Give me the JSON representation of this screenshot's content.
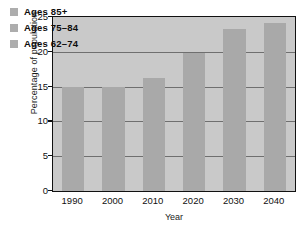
{
  "chart_data": {
    "type": "bar",
    "title": "",
    "xlabel": "Year",
    "ylabel": "Percentage of population",
    "categories": [
      "1990",
      "2000",
      "2010",
      "2020",
      "2030",
      "2040"
    ],
    "values": [
      15.0,
      15.0,
      16.3,
      19.9,
      23.3,
      24.2
    ],
    "series": [
      {
        "name": "Percentage of population",
        "values": [
          15.0,
          15.0,
          16.3,
          19.9,
          23.3,
          24.2
        ]
      }
    ],
    "ylim": [
      0,
      25
    ],
    "yticks": [
      0,
      5,
      10,
      15,
      20,
      25
    ],
    "ytick_labels": [
      "0",
      "5",
      "10",
      "15",
      "20",
      "25"
    ],
    "xtick_labels": [
      "1990",
      "2000",
      "2010",
      "2020",
      "2030",
      "2040"
    ],
    "grid": true,
    "legend_position": "upper-left",
    "legend": [
      {
        "label": "Ages 85+",
        "color": "#adadad"
      },
      {
        "label": "Ages 75–84",
        "color": "#adadad"
      },
      {
        "label": "Ages 62–74",
        "color": "#adadad"
      }
    ],
    "colors": {
      "bar": "#a9a9a9",
      "plot_background": "#c9c9c9",
      "gridline": "#6f6f6f",
      "frame": "#111111",
      "figure_background": "#ffffff",
      "text": "#101010"
    }
  }
}
